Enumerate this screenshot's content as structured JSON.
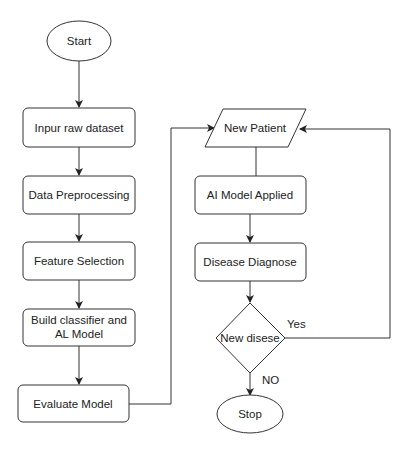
{
  "diagram": {
    "type": "flowchart",
    "nodes": {
      "start": {
        "label": "Start",
        "shape": "ellipse"
      },
      "input": {
        "label": "Inpur raw dataset",
        "shape": "rounded-rect"
      },
      "preprocess": {
        "label": "Data Preprocessing",
        "shape": "rounded-rect"
      },
      "feature": {
        "label": "Feature Selection",
        "shape": "rounded-rect"
      },
      "build": {
        "label_line1": "Build classifier and",
        "label_line2": "AL Model",
        "shape": "rounded-rect"
      },
      "evaluate": {
        "label": "Evaluate Model",
        "shape": "rounded-rect"
      },
      "patient": {
        "label": "New Patient",
        "shape": "parallelogram"
      },
      "applied": {
        "label": "AI Model Applied",
        "shape": "rounded-rect"
      },
      "diagnose": {
        "label": "Disease Diagnose",
        "shape": "rounded-rect"
      },
      "decision": {
        "label": "New disese",
        "shape": "diamond"
      },
      "stop": {
        "label": "Stop",
        "shape": "ellipse"
      }
    },
    "edges": {
      "yes": {
        "label": "Yes",
        "from": "decision",
        "to": "patient"
      },
      "no": {
        "label": "NO",
        "from": "decision",
        "to": "stop"
      }
    },
    "colors": {
      "stroke": "#333333",
      "fill": "#ffffff",
      "text": "#222222"
    }
  }
}
